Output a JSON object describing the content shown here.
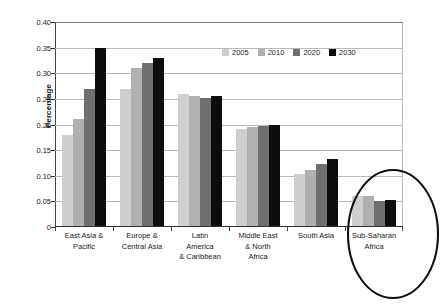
{
  "chart_data": {
    "type": "bar",
    "title": "",
    "subtitle": "",
    "xlabel": "",
    "ylabel": "Percentage",
    "ylim": [
      0,
      0.4
    ],
    "ytick_values": [
      0,
      0.05,
      0.1,
      0.15,
      0.2,
      0.25,
      0.3,
      0.35,
      0.4
    ],
    "ytick_labels": [
      "0",
      "0.05",
      "0.10",
      "0.15",
      "0.20",
      "0.25",
      "0.30",
      "0.35",
      "0.40"
    ],
    "grid": "horizontal",
    "legend_position": "top-right-inside",
    "categories": [
      "East Asia &\nPacific",
      "Europe &\nCentral Asia",
      "Latin\nAmerica\n& Caribbean",
      "Middle East\n& North\nAfrica",
      "South Asia",
      "Sub-Saharan\nAfrica"
    ],
    "series": [
      {
        "name": "2005",
        "color": "#cfcfcf",
        "values": [
          0.18,
          0.27,
          0.259,
          0.192,
          0.103,
          0.061
        ]
      },
      {
        "name": "2010",
        "color": "#b0b0b0",
        "values": [
          0.21,
          0.31,
          0.256,
          0.196,
          0.111,
          0.061
        ]
      },
      {
        "name": "2020",
        "color": "#6f6f6f",
        "values": [
          0.27,
          0.32,
          0.251,
          0.197,
          0.122,
          0.051
        ]
      },
      {
        "name": "2030",
        "color": "#0d0d0d",
        "values": [
          0.35,
          0.33,
          0.256,
          0.2,
          0.132,
          0.053
        ]
      }
    ],
    "annotations": [
      {
        "type": "ellipse",
        "name": "sub-saharan-africa-highlight",
        "target_category": "Sub-Saharan\nAfrica",
        "color": "#111111"
      }
    ]
  },
  "axis": {
    "y_title": "Percentage"
  }
}
